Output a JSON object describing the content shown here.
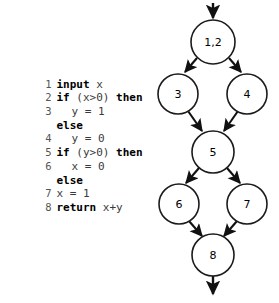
{
  "figure": {
    "type": "control-flow-graph-with-code",
    "background_color": "#ffffff",
    "ink_color": "#111111"
  },
  "code": {
    "language": "pseudocode",
    "lines": [
      {
        "number": "1",
        "indent": 0,
        "keyword": "input",
        "rest": " x"
      },
      {
        "number": "2",
        "indent": 0,
        "keyword": "if",
        "rest": " (x>0) ",
        "keyword2": "then"
      },
      {
        "number": "3",
        "indent": 2,
        "keyword": "",
        "rest": "y = 1"
      },
      {
        "number": "",
        "indent": 0,
        "keyword": "else",
        "rest": ""
      },
      {
        "number": "4",
        "indent": 2,
        "keyword": "",
        "rest": "y = 0"
      },
      {
        "number": "5",
        "indent": 0,
        "keyword": "if",
        "rest": " (y>0) ",
        "keyword2": "then"
      },
      {
        "number": "6",
        "indent": 2,
        "keyword": "",
        "rest": "x = 0"
      },
      {
        "number": "",
        "indent": 0,
        "keyword": "else",
        "rest": ""
      },
      {
        "number": "7",
        "indent": 0,
        "keyword": "",
        "rest": "x = 1"
      },
      {
        "number": "8",
        "indent": 0,
        "keyword": "return",
        "rest": " x+y"
      }
    ],
    "full_text": "1 input x\n2 if (x>0) then\n3   y = 1\n  else\n4   y = 0\n5 if (y>0) then\n6   x = 0\n  else\n7 x = 1\n8 return x+y"
  },
  "graph": {
    "nodes": [
      {
        "id": "n12",
        "label": "1,2",
        "cx": 73,
        "cy": 42,
        "r": 22
      },
      {
        "id": "n3",
        "label": "3",
        "cx": 38,
        "cy": 94,
        "r": 20
      },
      {
        "id": "n4",
        "label": "4",
        "cx": 107,
        "cy": 94,
        "r": 20
      },
      {
        "id": "n5",
        "label": "5",
        "cx": 73,
        "cy": 152,
        "r": 21
      },
      {
        "id": "n6",
        "label": "6",
        "cx": 39,
        "cy": 204,
        "r": 20
      },
      {
        "id": "n7",
        "label": "7",
        "cx": 107,
        "cy": 204,
        "r": 20
      },
      {
        "id": "n8",
        "label": "8",
        "cx": 73,
        "cy": 255,
        "r": 21
      }
    ],
    "edges": [
      {
        "from": "entry",
        "to": "n12"
      },
      {
        "from": "n12",
        "to": "n3"
      },
      {
        "from": "n12",
        "to": "n4"
      },
      {
        "from": "n3",
        "to": "n5"
      },
      {
        "from": "n4",
        "to": "n5"
      },
      {
        "from": "n5",
        "to": "n6"
      },
      {
        "from": "n5",
        "to": "n7"
      },
      {
        "from": "n6",
        "to": "n8"
      },
      {
        "from": "n7",
        "to": "n8"
      },
      {
        "from": "n8",
        "to": "exit"
      }
    ]
  }
}
